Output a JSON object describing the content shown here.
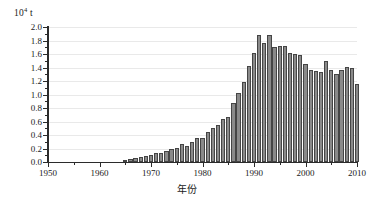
{
  "chart_data": {
    "type": "bar",
    "title": "",
    "subtitle": "",
    "xlabel": "年份",
    "ylabel": "",
    "yunit_mantissa": "10",
    "yunit_exponent": "4",
    "yunit_suffix": " t",
    "xlim": [
      1950,
      2010
    ],
    "ylim": [
      0.0,
      2.0
    ],
    "ytick_step": 0.2,
    "ytick_minor_step": 0.1,
    "xtick_step": 10,
    "xtick_minor_step": 5,
    "grid": true,
    "legend": "none",
    "bar_color": "#8a8a8a",
    "bar_edge_color": "#454545",
    "axis_color": "#2b2b2b",
    "grid_color": "#e9e9e9",
    "ytick_labels": [
      "0.0",
      "0.2",
      "0.4",
      "0.6",
      "0.8",
      "1.0",
      "1.2",
      "1.4",
      "1.6",
      "1.8",
      "2.0"
    ],
    "ytick_values": [
      0.0,
      0.2,
      0.4,
      0.6,
      0.8,
      1.0,
      1.2,
      1.4,
      1.6,
      1.8,
      2.0
    ],
    "ytick_minor_values": [
      0.1,
      0.3,
      0.5,
      0.7,
      0.9,
      1.1,
      1.3,
      1.5,
      1.7,
      1.9
    ],
    "xtick_labels": [
      "1950",
      "1960",
      "1970",
      "1980",
      "1990",
      "2000",
      "2010"
    ],
    "xtick_values": [
      1950,
      1960,
      1970,
      1980,
      1990,
      2000,
      2010
    ],
    "xtick_minor_values": [
      1955,
      1965,
      1975,
      1985,
      1995,
      2005
    ],
    "categories": [
      1950,
      1951,
      1952,
      1953,
      1954,
      1955,
      1956,
      1957,
      1958,
      1959,
      1960,
      1961,
      1962,
      1963,
      1964,
      1965,
      1966,
      1967,
      1968,
      1969,
      1970,
      1971,
      1972,
      1973,
      1974,
      1975,
      1976,
      1977,
      1978,
      1979,
      1980,
      1981,
      1982,
      1983,
      1984,
      1985,
      1986,
      1987,
      1988,
      1989,
      1990,
      1991,
      1992,
      1993,
      1994,
      1995,
      1996,
      1997,
      1998,
      1999,
      2000,
      2001,
      2002,
      2003,
      2004,
      2005,
      2006,
      2007,
      2008,
      2009,
      2010
    ],
    "values": [
      0.0,
      0.0,
      0.0,
      0.0,
      0.0,
      0.0,
      0.0,
      0.0,
      0.0,
      0.0,
      0.0,
      0.0,
      0.0,
      0.0,
      0.0,
      0.02,
      0.04,
      0.06,
      0.07,
      0.09,
      0.11,
      0.13,
      0.14,
      0.16,
      0.19,
      0.21,
      0.26,
      0.24,
      0.3,
      0.35,
      0.36,
      0.44,
      0.5,
      0.55,
      0.63,
      0.66,
      0.88,
      1.02,
      1.18,
      1.42,
      1.62,
      1.88,
      1.76,
      1.88,
      1.7,
      1.72,
      1.72,
      1.62,
      1.6,
      1.58,
      1.45,
      1.36,
      1.35,
      1.34,
      1.5,
      1.36,
      1.31,
      1.36,
      1.41,
      1.4,
      1.15
    ]
  }
}
